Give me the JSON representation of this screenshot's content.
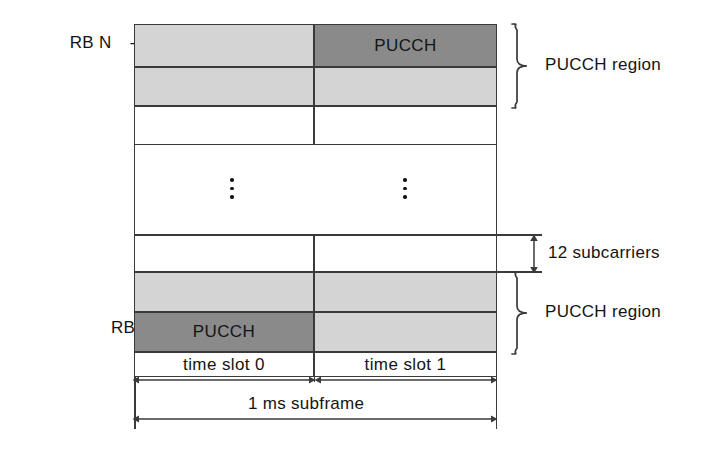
{
  "figure": {
    "type": "resource-grid-diagram",
    "colors": {
      "light_gray": "#d4d4d4",
      "dark_gray": "#8a8a8a",
      "line": "#3a3a3a",
      "text": "#141414",
      "background": "#ffffff"
    }
  },
  "row_labels": {
    "top": {
      "prefix": "RB N",
      "superscript": "UL",
      "subscript": "RB",
      "suffix": "–1"
    },
    "bottom": "RB 0"
  },
  "cells": {
    "pucch_top": "PUCCH",
    "pucch_bottom": "PUCCH"
  },
  "annotations": {
    "pucch_region_top": "PUCCH region",
    "pucch_region_bottom": "PUCCH region",
    "subcarriers": "12 subcarriers"
  },
  "time_axis": {
    "slot0": "time slot 0",
    "slot1": "time slot 1",
    "subframe": "1 ms subframe"
  }
}
